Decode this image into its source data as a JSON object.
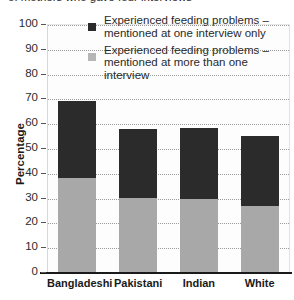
{
  "chart_data": {
    "type": "bar",
    "stacked": true,
    "title": "of mothers who gave four interviews",
    "xlabel": "",
    "ylabel": "Percentage",
    "ylim": [
      0,
      100
    ],
    "yticks": [
      0,
      10,
      20,
      30,
      40,
      50,
      60,
      70,
      80,
      90,
      100
    ],
    "grid": true,
    "legend_position": "top-right-inside",
    "categories": [
      "Bangladeshi",
      "Pakistani",
      "Indian",
      "White"
    ],
    "series": [
      {
        "name": "Experienced feeding problems –\nmentioned at more than one interview",
        "color": "#a8a8a8",
        "values": [
          38,
          30,
          29.5,
          26.5
        ]
      },
      {
        "name": "Experienced feeding problems –\nmentioned at one interview only",
        "color": "#2b2b2b",
        "values": [
          31,
          27.5,
          28.5,
          28.5
        ]
      }
    ],
    "totals": [
      69,
      57.5,
      58,
      55
    ]
  },
  "yaxis": {
    "label": "Percentage",
    "ticks": [
      "100",
      "90",
      "80",
      "70",
      "60",
      "50",
      "40",
      "30",
      "20",
      "10",
      "0"
    ]
  },
  "xaxis": {
    "ticks": [
      "Bangladeshi",
      "Pakistani",
      "Indian",
      "White"
    ]
  },
  "legend": {
    "items": [
      {
        "swatch": "dark-square-swatch",
        "label": "Experienced feeding problems –\nmentioned at one interview only"
      },
      {
        "swatch": "light-square-swatch",
        "label": "Experienced feeding problems –\nmentioned at more than one interview"
      }
    ]
  },
  "colors": {
    "dark_segment": "#2b2b2b",
    "light_segment": "#a8a8a8",
    "axis": "#1a1a1a",
    "gridline": "#9a9a9a",
    "plot_background": "#fdfdfd"
  }
}
